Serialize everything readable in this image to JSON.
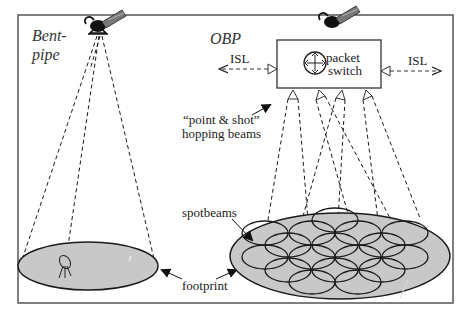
{
  "diagram": {
    "left_panel": {
      "title_line1": "Bent-",
      "title_line2": "pipe"
    },
    "right_panel": {
      "title": "OBP"
    },
    "labels": {
      "isl_left": "ISL",
      "isl_right": "ISL",
      "packet_switch_line1": "packet",
      "packet_switch_line2": "switch",
      "hopping_line1": "“point & shot”",
      "hopping_line2": "hopping beams",
      "spotbeams": "spotbeams",
      "footprint": "footprint"
    },
    "colors": {
      "frame": "#555555",
      "footprint_fill": "#c8c8c8",
      "line": "#1a1a1a"
    },
    "icons": [
      "satellite-icon",
      "packet-switch-icon",
      "ground-antenna-icon"
    ]
  }
}
